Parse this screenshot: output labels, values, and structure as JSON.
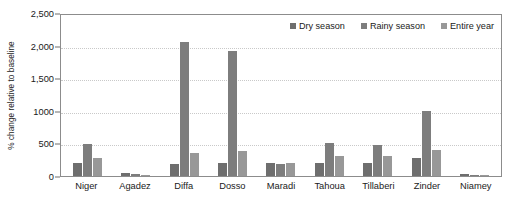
{
  "chart_data": {
    "type": "bar",
    "title": "",
    "xlabel": "",
    "ylabel": "% change relative to baseline",
    "ylim": [
      0,
      2500
    ],
    "grid": true,
    "legend_position": "top-right",
    "categories": [
      "Niger",
      "Agadez",
      "Diffa",
      "Dosso",
      "Maradi",
      "Tahoua",
      "Tillaberi",
      "Zinder",
      "Niamey"
    ],
    "ytick_labels": [
      "2,500",
      "2,000",
      "1,500",
      "1000",
      "500",
      "0"
    ],
    "ytick_values": [
      2500,
      2000,
      1500,
      1000,
      500,
      0
    ],
    "series": [
      {
        "name": "Dry season",
        "color": "#6e6e6e",
        "values": [
          200,
          40,
          180,
          200,
          200,
          195,
          200,
          280,
          25
        ]
      },
      {
        "name": "Rainy season",
        "color": "#7d7d7d",
        "values": [
          490,
          25,
          2060,
          1910,
          190,
          510,
          480,
          1000,
          15
        ]
      },
      {
        "name": "Entire year",
        "color": "#989898",
        "values": [
          280,
          20,
          350,
          390,
          200,
          310,
          300,
          400,
          10
        ]
      }
    ]
  },
  "legend": {
    "items": [
      {
        "label": "Dry season"
      },
      {
        "label": "Rainy season"
      },
      {
        "label": "Entire year"
      }
    ]
  }
}
